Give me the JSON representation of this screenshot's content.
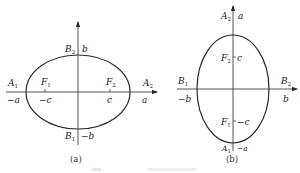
{
  "figures": [
    {
      "id": "a",
      "caption": "(a)",
      "orientation": "horizontal major axis",
      "points": {
        "A1": {
          "label": "A",
          "sub": "1",
          "coord": "−a"
        },
        "A2": {
          "label": "A",
          "sub": "2",
          "coord": "a"
        },
        "B1": {
          "label": "B",
          "sub": "1",
          "coord": "−b"
        },
        "B2": {
          "label": "B",
          "sub": "2",
          "coord": "b"
        },
        "F1": {
          "label": "F",
          "sub": "1",
          "coord": "−c"
        },
        "F2": {
          "label": "F",
          "sub": "2",
          "coord": "c"
        }
      }
    },
    {
      "id": "b",
      "caption": "(b)",
      "orientation": "vertical major axis",
      "points": {
        "A1": {
          "label": "A",
          "sub": "1",
          "coord": "−a"
        },
        "A2": {
          "label": "A",
          "sub": "2",
          "coord": "a"
        },
        "B1": {
          "label": "B",
          "sub": "1",
          "coord": "−b"
        },
        "B2": {
          "label": "B",
          "sub": "2",
          "coord": "b"
        },
        "F1": {
          "label": "F",
          "sub": "1",
          "coord": "−c"
        },
        "F2": {
          "label": "F",
          "sub": "2",
          "coord": "c"
        }
      }
    }
  ],
  "colors": {
    "stroke": "#2a2a2a",
    "text": "#222222"
  }
}
